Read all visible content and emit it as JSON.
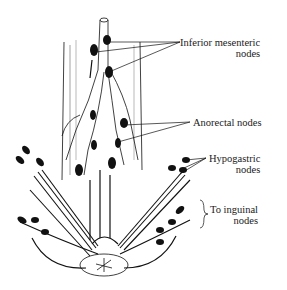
{
  "figure": {
    "labels": {
      "inferior_mesenteric": {
        "line1": "Inferior mesenteric",
        "line2": "nodes"
      },
      "anorectal": {
        "line1": "Anorectal nodes"
      },
      "hypogastric": {
        "line1": "Hypogastric",
        "line2": "nodes"
      },
      "inguinal": {
        "line1": "To inguinal",
        "line2": "nodes"
      }
    },
    "colors": {
      "ink": "#111111",
      "background": "#ffffff"
    }
  }
}
